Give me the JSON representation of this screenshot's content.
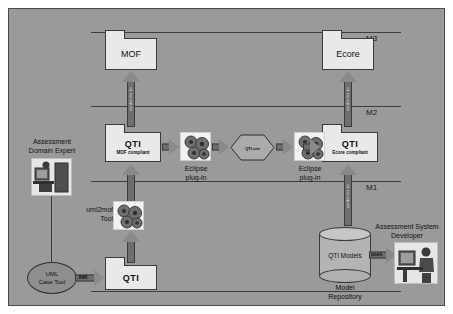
{
  "diagram": {
    "levels": [
      {
        "id": "m3",
        "label": "M3"
      },
      {
        "id": "m2",
        "label": "M2"
      },
      {
        "id": "m1",
        "label": "M1"
      }
    ],
    "packages": [
      {
        "id": "mof",
        "title": "MOF",
        "subtitle": ""
      },
      {
        "id": "ecore",
        "title": "Ecore",
        "subtitle": ""
      },
      {
        "id": "qti-mof",
        "title": "QTI",
        "subtitle": "MOF compliant"
      },
      {
        "id": "qti-ecore",
        "title": "QTI",
        "subtitle": "Ecore compliant"
      },
      {
        "id": "qti-bottom",
        "title": "QTI",
        "subtitle": ""
      }
    ],
    "tools": [
      {
        "id": "eclipse-plugin-1",
        "label": "Eclipse\nplug-in",
        "line1": "Eclipse",
        "line2": "plug-in"
      },
      {
        "id": "eclipse-plugin-2",
        "label": "Eclipse\nplug-in",
        "line1": "Eclipse",
        "line2": "plug-in"
      },
      {
        "id": "uml2mof-tool",
        "line1": "uml2mof",
        "line2": "Tool"
      }
    ],
    "artifact": {
      "id": "qti-xmi",
      "label": "QTI.xmi"
    },
    "conforms_label": "conforms to",
    "actors": [
      {
        "id": "assessment-domain-expert",
        "line1": "Assessment",
        "line2": "Domain Expert"
      },
      {
        "id": "assessment-system-developer",
        "line1": "Assessment System",
        "line2": "Developer"
      }
    ],
    "uml_case_tool": {
      "line1": "UML",
      "line2": "Case Tool"
    },
    "repository": {
      "inner_label": "QTI Models",
      "line1": "Model",
      "line2": "Repository"
    },
    "edge_labels": [
      {
        "id": "xmi-edge",
        "label": ".XMI"
      },
      {
        "id": "uses-edge",
        "label": "uses"
      }
    ],
    "colors": {
      "background": "#9a9a9a",
      "package_fill": "#e9e9e9",
      "arrow_fill": "#7b7b7b",
      "line": "#3c3c3c",
      "cylinder_fill": "#b4b4b4"
    }
  }
}
